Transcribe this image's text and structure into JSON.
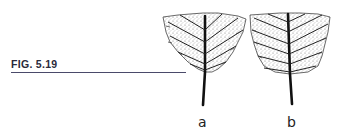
{
  "figure": {
    "caption": "FIG. 5.19",
    "panels": [
      {
        "id": "a",
        "label": "a",
        "description": "leaf base, narrowly tapered"
      },
      {
        "id": "b",
        "label": "b",
        "description": "leaf base, broadly rounded"
      }
    ],
    "colors": {
      "ink": "#1a1a1a",
      "stipple": "#8a8a8a",
      "rule": "#4a4a6a"
    }
  }
}
